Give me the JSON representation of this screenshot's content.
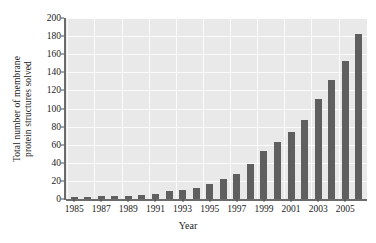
{
  "chart_data": {
    "type": "bar",
    "title": "",
    "xlabel": "Year",
    "ylabel": "Total number of membrane protein structures solved",
    "ylabel_lines": [
      "Total number of membrane",
      "protein structures solved"
    ],
    "categories": [
      1985,
      1986,
      1987,
      1988,
      1989,
      1990,
      1991,
      1992,
      1993,
      1994,
      1995,
      1996,
      1997,
      1998,
      1999,
      2000,
      2001,
      2002,
      2003,
      2004,
      2005,
      2006
    ],
    "values": [
      2,
      2,
      3,
      3,
      3,
      4,
      6,
      9,
      10,
      12,
      17,
      22,
      28,
      39,
      53,
      63,
      74,
      87,
      110,
      132,
      153,
      182
    ],
    "ylim": [
      0,
      200
    ],
    "yticks": [
      0,
      20,
      40,
      60,
      80,
      100,
      120,
      140,
      160,
      180,
      200
    ],
    "xticks": [
      1985,
      1987,
      1989,
      1991,
      1993,
      1995,
      1997,
      1999,
      2001,
      2003,
      2005
    ],
    "xlim": [
      1984.4,
      2006.6
    ],
    "grid": true,
    "legend": "none",
    "bar_color": "#5f5f5f",
    "plot_background": "#e9e9e9",
    "grid_color": "#fbfbfb",
    "axis_color": "#6b6b6b",
    "figure_background": "#ffffff"
  }
}
